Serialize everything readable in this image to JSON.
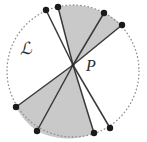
{
  "figure": {
    "width": 147,
    "height": 142,
    "background_color": "#ffffff",
    "labels": {
      "circle_label": "ℒ",
      "circle_label_meaning": "script-C",
      "point_label": "P"
    },
    "colors": {
      "shaded_sector_fill": "#c9c9c9",
      "unshaded_sector_fill": "#ffffff",
      "chord_stroke": "#3a3a3a",
      "circle_outline": "#9a9a9a",
      "vertex_dot": "#1a1a1a",
      "label_text": "#2b2b2b"
    },
    "circle": {
      "center_x": 73,
      "center_y": 71,
      "radius": 66,
      "outline_style": "dotted"
    },
    "apex_point": {
      "name": "P",
      "x": 73,
      "y": 65
    },
    "boundary_points": [
      {
        "id": "A",
        "x": 46,
        "y": 10,
        "angle_deg": 114
      },
      {
        "id": "B",
        "x": 58,
        "y": 7,
        "angle_deg": 103
      },
      {
        "id": "C",
        "x": 104,
        "y": 13,
        "angle_deg": 60
      },
      {
        "id": "D",
        "x": 122,
        "y": 25,
        "angle_deg": 44
      },
      {
        "id": "E",
        "x": 110,
        "y": 128,
        "angle_deg": -59
      },
      {
        "id": "F",
        "x": 94,
        "y": 133,
        "angle_deg": -70
      },
      {
        "id": "G",
        "x": 37,
        "y": 131,
        "angle_deg": -114
      },
      {
        "id": "H",
        "x": 16,
        "y": 107,
        "angle_deg": -149
      }
    ],
    "sectors": [
      {
        "id": "sector-1",
        "from": "A",
        "to": "B",
        "shaded": false
      },
      {
        "id": "sector-2",
        "from": "B",
        "to": "C",
        "shaded": true
      },
      {
        "id": "sector-3",
        "from": "C",
        "to": "D",
        "shaded": false
      },
      {
        "id": "sector-4",
        "from": "E",
        "to": "F",
        "shaded": false
      },
      {
        "id": "sector-5",
        "from": "F",
        "to": "G",
        "shaded": true
      },
      {
        "id": "sector-6",
        "from": "G",
        "to": "H",
        "shaded": true
      },
      {
        "id": "sector-7",
        "from": "H",
        "to": "A",
        "shaded": false
      }
    ],
    "chords": [
      {
        "id": "chord-PA",
        "to": "A"
      },
      {
        "id": "chord-PB",
        "to": "B"
      },
      {
        "id": "chord-PC",
        "to": "C"
      },
      {
        "id": "chord-PD",
        "to": "D"
      },
      {
        "id": "chord-PE",
        "to": "E"
      },
      {
        "id": "chord-PF",
        "to": "F"
      },
      {
        "id": "chord-PG",
        "to": "G"
      },
      {
        "id": "chord-PH",
        "to": "H"
      }
    ]
  }
}
